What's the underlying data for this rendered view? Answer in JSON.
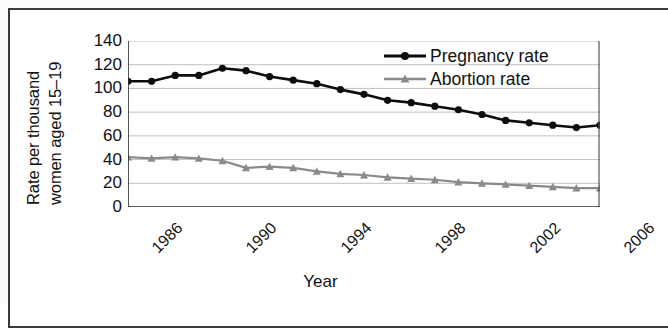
{
  "figure": {
    "x_axis_title": "Year",
    "y_axis_title_line1": "Rate per thousand",
    "y_axis_title_line2": "women aged 15–19"
  },
  "legend": {
    "items": [
      {
        "label": "Pregnancy rate",
        "color": "#0d0d0d",
        "marker": "circle-marker"
      },
      {
        "label": "Abortion rate",
        "color": "#8a8a8a",
        "marker": "triangle-marker"
      }
    ]
  },
  "axis": {
    "y_ticks": [
      "140",
      "120",
      "100",
      "80",
      "60",
      "40",
      "20",
      "0"
    ],
    "x_ticks": [
      "1986",
      "1990",
      "1994",
      "1998",
      "2002",
      "2006"
    ]
  },
  "chart_data": {
    "type": "line",
    "title": "",
    "xlabel": "Year",
    "ylabel": "Rate per thousand women aged 15–19",
    "xlim": [
      1986,
      2006
    ],
    "ylim": [
      0,
      140
    ],
    "ytick_step": 20,
    "xtick_step": 4,
    "grid": "horizontal",
    "legend_position": "top-right",
    "x": [
      1986,
      1987,
      1988,
      1989,
      1990,
      1991,
      1992,
      1993,
      1994,
      1995,
      1996,
      1997,
      1998,
      1999,
      2000,
      2001,
      2002,
      2003,
      2004,
      2005,
      2006
    ],
    "series": [
      {
        "name": "Pregnancy rate",
        "color": "#0d0d0d",
        "marker": "circle",
        "values": [
          106,
          106,
          111,
          111,
          117,
          115,
          110,
          107,
          104,
          99,
          95,
          90,
          88,
          85,
          82,
          78,
          73,
          71,
          69,
          67,
          69
        ]
      },
      {
        "name": "Abortion rate",
        "color": "#8a8a8a",
        "marker": "triangle",
        "values": [
          42,
          41,
          42,
          41,
          39,
          33,
          34,
          33,
          30,
          28,
          27,
          25,
          24,
          23,
          21,
          20,
          19,
          18,
          17,
          16,
          16
        ]
      }
    ]
  }
}
